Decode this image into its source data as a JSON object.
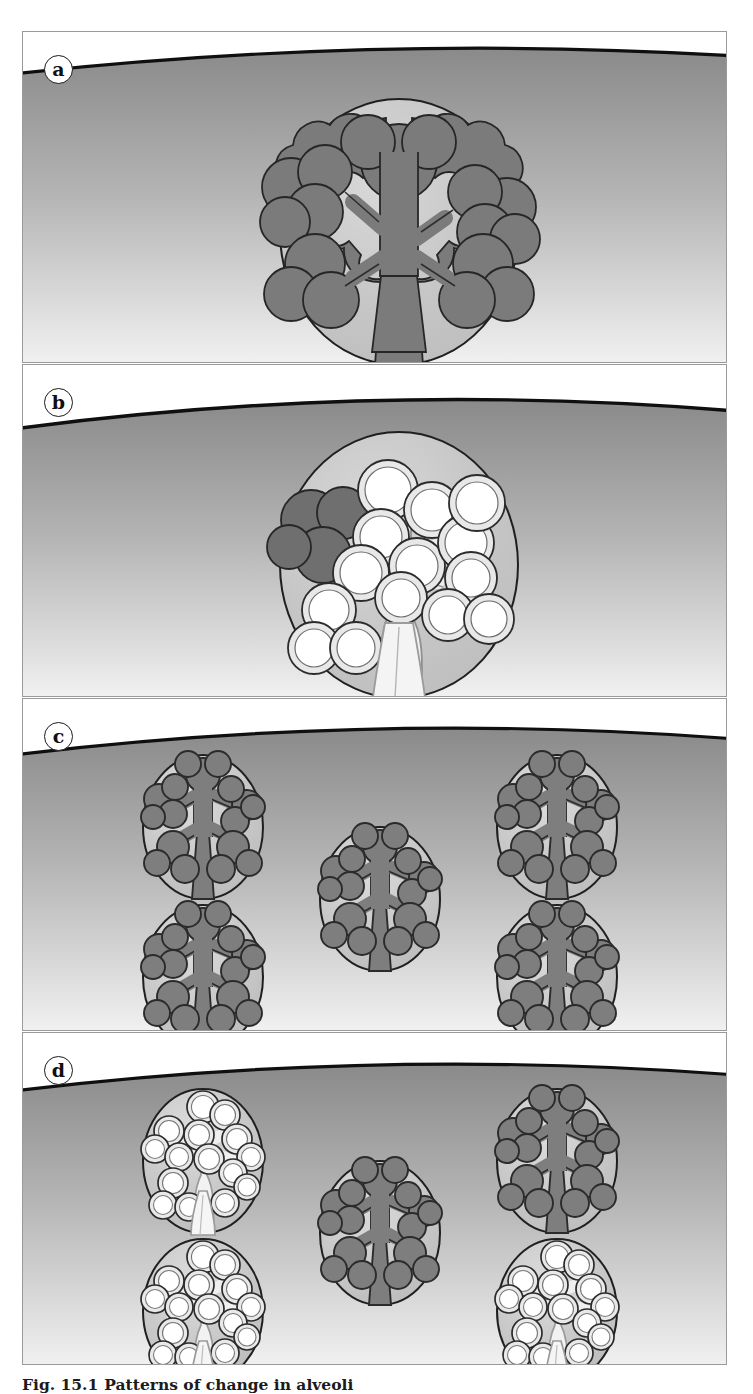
{
  "figure": {
    "id": "fig-15-1",
    "caption_number": "Fig. 15.1",
    "caption_text": "Patterns of change in alveoli",
    "panels": [
      {
        "key": "a",
        "label": "a",
        "name": "panel-a-normal-single-acinus",
        "description": "Normal single acinus: one large acinar unit containing a solid dark alveolar tree",
        "units": [
          {
            "cx": 376,
            "cy": 200,
            "rx": 119,
            "ry": 133,
            "state": "normal",
            "scale": 1.0
          }
        ]
      },
      {
        "key": "b",
        "label": "b",
        "name": "panel-b-panacinar-emphysema",
        "description": "Panacinar emphysema: almost the whole acinus is converted to enlarged hollow air spaces, with one small dark normal remnant",
        "units": [
          {
            "cx": 376,
            "cy": 200,
            "rx": 119,
            "ry": 133,
            "state": "destroyed",
            "scale": 1.0,
            "remnant": true
          }
        ]
      },
      {
        "key": "c",
        "label": "c",
        "name": "panel-c-normal-multiple-acini",
        "description": "Normal lung: five separate acini, each with an intact dark alveolar tree",
        "units": [
          {
            "cx": 203,
            "cy": 100,
            "rx": 62,
            "ry": 72,
            "state": "normal",
            "scale": 0.52
          },
          {
            "cx": 557,
            "cy": 100,
            "rx": 62,
            "ry": 72,
            "state": "normal",
            "scale": 0.52
          },
          {
            "cx": 380,
            "cy": 172,
            "rx": 62,
            "ry": 72,
            "state": "normal",
            "scale": 0.52
          },
          {
            "cx": 203,
            "cy": 250,
            "rx": 62,
            "ry": 72,
            "state": "normal",
            "scale": 0.52
          },
          {
            "cx": 557,
            "cy": 250,
            "rx": 62,
            "ry": 72,
            "state": "normal",
            "scale": 0.52
          }
        ]
      },
      {
        "key": "d",
        "label": "d",
        "name": "panel-d-centriacinar-emphysema",
        "description": "Patchy emphysema: three acini are destroyed into hollow enlarged air spaces while two acini remain normal",
        "units": [
          {
            "cx": 203,
            "cy": 100,
            "rx": 62,
            "ry": 72,
            "state": "destroyed",
            "scale": 0.52
          },
          {
            "cx": 557,
            "cy": 100,
            "rx": 62,
            "ry": 72,
            "state": "normal",
            "scale": 0.52
          },
          {
            "cx": 380,
            "cy": 172,
            "rx": 62,
            "ry": 72,
            "state": "normal",
            "scale": 0.52
          },
          {
            "cx": 203,
            "cy": 250,
            "rx": 62,
            "ry": 72,
            "state": "destroyed",
            "scale": 0.52
          },
          {
            "cx": 557,
            "cy": 250,
            "rx": 62,
            "ry": 72,
            "state": "destroyed",
            "scale": 0.52
          }
        ]
      }
    ]
  },
  "colors": {
    "page_background": "#ffffff",
    "frame_border": "#9a9a9a",
    "pleura_line": "#111111",
    "parenchyma_top": "#8c8c8c",
    "parenchyma_bottom": "#f2f2f2",
    "acinus_fill_light": "#c9c9c9",
    "acinus_outline": "#1f1f1f",
    "alveolar_tree_dark": "#7b7b7b",
    "alveolar_tree_outline": "#262626",
    "air_space_white": "#ffffff",
    "air_space_outline": "#2b2b2b",
    "label_text": "#101010"
  }
}
